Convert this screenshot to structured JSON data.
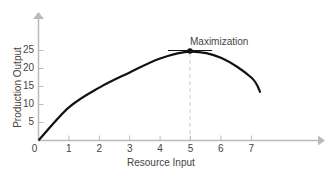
{
  "chart_data": {
    "type": "line",
    "title": "",
    "xlabel": "Resource Input",
    "ylabel": "Production Output",
    "xlim": [
      0,
      9
    ],
    "ylim": [
      0,
      30
    ],
    "x_ticks": [
      "0",
      "1",
      "2",
      "3",
      "4",
      "5",
      "6",
      "7"
    ],
    "y_ticks": [
      "5",
      "10",
      "15",
      "20",
      "25"
    ],
    "grid": false,
    "series": [
      {
        "name": "Production curve",
        "x": [
          0,
          1,
          2,
          3,
          4,
          5,
          6,
          7,
          7.3
        ],
        "y": [
          0,
          9.2,
          14.7,
          18.9,
          22.8,
          24.7,
          23.0,
          17.5,
          13.3
        ]
      }
    ],
    "annotations": [
      {
        "text": "Maximization",
        "x": 5,
        "y": 24.7,
        "marker": "dot",
        "tangent_line": true,
        "dashed_drop_line": true
      }
    ],
    "colors": {
      "curve": "#111111",
      "axis": "#bbbbbb",
      "dashed": "#cccccc",
      "text": "#444444"
    }
  }
}
